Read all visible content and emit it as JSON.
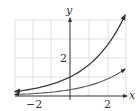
{
  "chart_data": {
    "type": "line",
    "title": "",
    "xlabel": "x",
    "ylabel": "y",
    "xlim": [
      -3,
      3
    ],
    "ylim": [
      0,
      4
    ],
    "grid": true,
    "x_ticks": [
      {
        "value": -2,
        "label": "−2"
      },
      {
        "value": 2,
        "label": "2"
      }
    ],
    "y_ticks": [
      {
        "value": 2,
        "label": "2"
      }
    ],
    "legend": null,
    "series": [
      {
        "name": "upper curve",
        "description": "exponential, passes through (0, 1)",
        "color": "#3a3a3a",
        "x": [
          -2.9,
          -2,
          -1,
          0,
          1,
          2,
          2.9
        ],
        "y": [
          0.23,
          0.37,
          0.61,
          1.0,
          1.65,
          2.72,
          4.26
        ]
      },
      {
        "name": "lower curve",
        "description": "exponential, passes through (0, ~0.33)",
        "color": "#5a5a5a",
        "x": [
          -2.9,
          -2,
          -1,
          0,
          1,
          2,
          2.9
        ],
        "y": [
          0.08,
          0.12,
          0.2,
          0.33,
          0.55,
          0.91,
          1.42
        ]
      }
    ]
  },
  "labels": {
    "x_axis": "x",
    "y_axis": "y",
    "tick_x_neg2": "−2",
    "tick_x_2": "2",
    "tick_y_2": "2"
  }
}
